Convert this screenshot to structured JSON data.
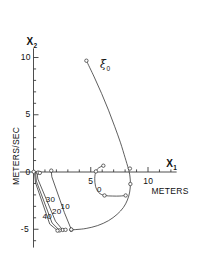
{
  "figure": {
    "axes": {
      "x": {
        "name": "X",
        "name_sub": "1",
        "unit_label": "METERS",
        "ticks": [
          {
            "value": 5,
            "label": "5"
          },
          {
            "value": 10,
            "label": "10"
          }
        ],
        "range": [
          -1.2,
          12.5
        ]
      },
      "y": {
        "name": "X",
        "name_sub": "2",
        "unit_label": "METERS/SEC",
        "ticks": [
          {
            "value": 10,
            "label": "10"
          },
          {
            "value": 5,
            "label": "5"
          },
          {
            "value": 0,
            "label": "0"
          },
          {
            "value": -5,
            "label": "-5"
          }
        ],
        "range": [
          -6.6,
          10.8
        ]
      }
    },
    "annotations": [
      {
        "name": "initial-state-label",
        "text": "ξ",
        "subscript": "0",
        "x": 5.55,
        "y": 9.35
      },
      {
        "name": "curve-label-0",
        "text": "0",
        "x": 5.55,
        "y": -1.55
      },
      {
        "name": "curve-label-10",
        "text": "10",
        "x": 2.35,
        "y": -3.05
      },
      {
        "name": "curve-label-20",
        "text": "20",
        "x": 1.62,
        "y": -3.45
      },
      {
        "name": "curve-label-30",
        "text": "30",
        "x": 1.07,
        "y": -2.45
      },
      {
        "name": "curve-label-40",
        "text": "40",
        "x": 0.78,
        "y": -3.95
      }
    ]
  },
  "chart_data": {
    "type": "line",
    "title": "",
    "xlabel": "X1 METERS",
    "ylabel": "X2 METERS/SEC",
    "xlim": [
      -1.2,
      12.5
    ],
    "ylim": [
      -6.6,
      10.8
    ],
    "grid": false,
    "legend": "none",
    "series": [
      {
        "name": "main-trajectory",
        "label": "ξ0",
        "marker": "circle-open-endpoints",
        "points": [
          [
            4.62,
            9.72
          ],
          [
            5.3,
            8.3
          ],
          [
            5.95,
            6.85
          ],
          [
            6.55,
            5.4
          ],
          [
            7.1,
            3.95
          ],
          [
            7.6,
            2.55
          ],
          [
            8.0,
            1.25
          ],
          [
            8.28,
            0.3
          ],
          [
            8.42,
            -0.35
          ],
          [
            8.46,
            -1.05
          ],
          [
            8.4,
            -1.75
          ],
          [
            8.2,
            -2.45
          ],
          [
            7.85,
            -3.1
          ],
          [
            7.3,
            -3.7
          ],
          [
            6.55,
            -4.25
          ],
          [
            5.6,
            -4.68
          ],
          [
            4.6,
            -4.93
          ],
          [
            3.8,
            -5.02
          ],
          [
            3.3,
            -5.05
          ]
        ]
      },
      {
        "name": "inner-loop",
        "points": [
          [
            6.1,
            0.55
          ],
          [
            5.72,
            0.38
          ],
          [
            5.45,
            0.05
          ],
          [
            5.35,
            -0.55
          ],
          [
            5.42,
            -1.25
          ],
          [
            5.7,
            -1.8
          ],
          [
            6.2,
            -2.05
          ],
          [
            6.9,
            -2.1
          ],
          [
            7.55,
            -2.1
          ],
          [
            8.05,
            -2.05
          ]
        ]
      },
      {
        "name": "fan-line-10",
        "points": [
          [
            1.55,
            0.12
          ],
          [
            1.6,
            -0.42
          ],
          [
            2.7,
            -3.55
          ],
          [
            3.3,
            -5.02
          ]
        ]
      },
      {
        "name": "fan-line-20",
        "points": [
          [
            0.3,
            0.05
          ],
          [
            0.38,
            -0.62
          ],
          [
            1.92,
            -4.3
          ],
          [
            2.55,
            -5.06
          ]
        ]
      },
      {
        "name": "fan-line-30",
        "points": [
          [
            0.18,
            -0.05
          ],
          [
            0.25,
            -0.8
          ],
          [
            1.62,
            -4.45
          ],
          [
            2.28,
            -5.1
          ]
        ]
      },
      {
        "name": "fan-line-40",
        "points": [
          [
            0.1,
            -0.18
          ],
          [
            0.18,
            -0.95
          ],
          [
            1.42,
            -4.55
          ],
          [
            2.1,
            -5.12
          ]
        ]
      },
      {
        "name": "origin-cluster",
        "points": [
          [
            0.02,
            0.02
          ],
          [
            0.4,
            -0.05
          ],
          [
            0.55,
            -0.08
          ]
        ]
      }
    ]
  }
}
